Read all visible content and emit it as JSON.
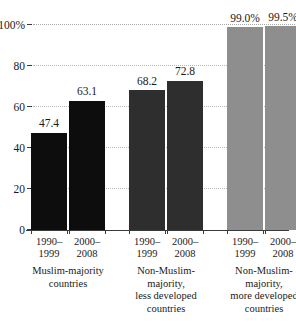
{
  "chart_data": {
    "type": "bar",
    "title": "",
    "subtitle": "",
    "xlabel": "",
    "ylabel": "",
    "ylim": [
      0,
      100
    ],
    "grid": true,
    "legend": "none",
    "y_ticks": [
      {
        "value": 0,
        "label": "0"
      },
      {
        "value": 20,
        "label": "20"
      },
      {
        "value": 40,
        "label": "40"
      },
      {
        "value": 60,
        "label": "60"
      },
      {
        "value": 80,
        "label": "80"
      },
      {
        "value": 100,
        "label": "100%"
      }
    ],
    "groups": [
      {
        "label_lines": [
          "Muslim-majority",
          "countries"
        ],
        "color": "#0d0d0d",
        "bars": [
          {
            "period_lines": [
              "1990–",
              "1999"
            ],
            "value": 47.4,
            "value_label": "47.4"
          },
          {
            "period_lines": [
              "2000–",
              "2008"
            ],
            "value": 63.1,
            "value_label": "63.1"
          }
        ]
      },
      {
        "label_lines": [
          "Non-Muslim-",
          "majority,",
          "less developed",
          "countries"
        ],
        "color": "#2e2e2e",
        "bars": [
          {
            "period_lines": [
              "1990–",
              "1999"
            ],
            "value": 68.2,
            "value_label": "68.2"
          },
          {
            "period_lines": [
              "2000–",
              "2008"
            ],
            "value": 72.8,
            "value_label": "72.8"
          }
        ]
      },
      {
        "label_lines": [
          "Non-Muslim-",
          "majority,",
          "more developed",
          "countries"
        ],
        "color": "#8e8e8e",
        "bars": [
          {
            "period_lines": [
              "1990–",
              "1999"
            ],
            "value": 99.0,
            "value_label": "99.0%"
          },
          {
            "period_lines": [
              "2000–",
              "2008"
            ],
            "value": 99.5,
            "value_label": "99.5%"
          }
        ]
      }
    ],
    "categories": [
      "Muslim-majority countries 1990–1999",
      "Muslim-majority countries 2000–2008",
      "Non-Muslim-majority, less developed countries 1990–1999",
      "Non-Muslim-majority, less developed countries 2000–2008",
      "Non-Muslim-majority, more developed countries 1990–1999",
      "Non-Muslim-majority, more developed countries 2000–2008"
    ],
    "values": [
      47.4,
      63.1,
      68.2,
      72.8,
      99.0,
      99.5
    ],
    "colors": {
      "bar_dark": "#0d0d0d",
      "bar_mid": "#2e2e2e",
      "bar_light": "#8e8e8e",
      "axis": "#3a3a3a",
      "grid": "#b8b8b8",
      "text": "#1a1a1a",
      "background": "#ffffff"
    }
  }
}
